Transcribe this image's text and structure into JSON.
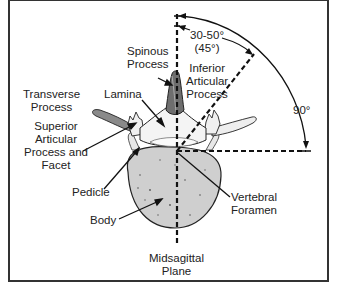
{
  "diagram": {
    "labels": {
      "spinous_process": "Spinous\nProcess",
      "inferior_articular_process": "Inferior\nArticular\nProcess",
      "transverse_process": "Transverse\nProcess",
      "lamina": "Lamina",
      "superior_articular_process": "Superior\nArticular\nProcess and\nFacet",
      "pedicle": "Pedicle",
      "body": "Body",
      "vertebral_foramen": "Vertebral\nForamen",
      "midsagittal_plane": "Midsagittal\nPlane"
    },
    "angles": {
      "facet_range": "30-50°\n(45°)",
      "right_angle": "90°"
    },
    "colors": {
      "line": "#111111",
      "bone_fill": "#c8c8c8",
      "bone_dark": "#6e6e6e",
      "text": "#222222",
      "border": "#333333"
    }
  }
}
